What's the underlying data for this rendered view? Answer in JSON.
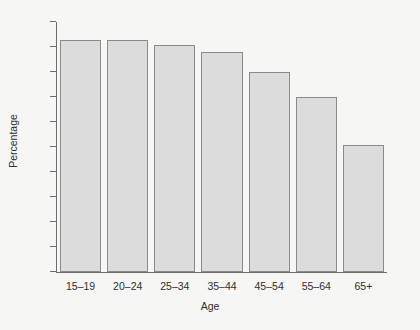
{
  "chart_data": {
    "type": "bar",
    "title": "",
    "xlabel": "Age",
    "ylabel": "Percentage",
    "categories": [
      "15–19",
      "20–24",
      "25–34",
      "35–44",
      "45–54",
      "55–64",
      "65+"
    ],
    "values": [
      93,
      93,
      91,
      88,
      80,
      70,
      51
    ],
    "ylim": [
      0,
      100
    ],
    "ytick_values": [
      0,
      10,
      20,
      30,
      40,
      50,
      60,
      70,
      80,
      90,
      100
    ],
    "ytick_labels": [
      "0",
      "10",
      "20",
      "30",
      "40",
      "50",
      "60",
      "70",
      "80",
      "90",
      "100"
    ],
    "grid": false,
    "legend": false,
    "bar_fill_color": "#dcdcdc",
    "bar_border_color": "#8a8a8a",
    "axis_color": "#6d6d6d",
    "background_color": "#f6f6f4"
  }
}
